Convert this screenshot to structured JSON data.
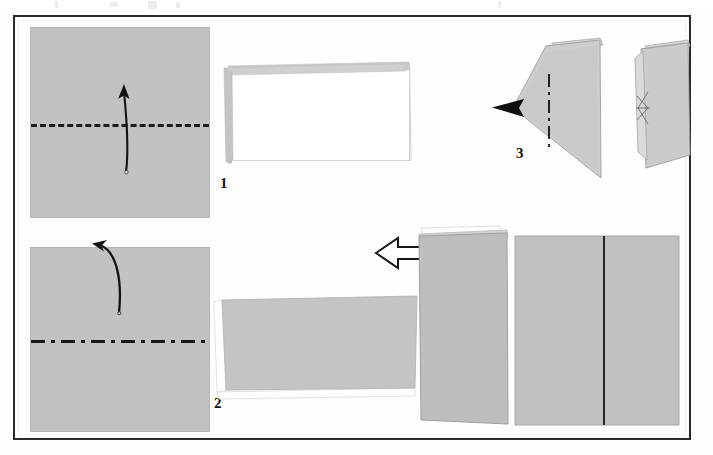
{
  "document": {
    "kind": "origami-instruction-diagram",
    "title": "Origami paper folding sequence",
    "background_color": "#fdfdfd",
    "frame_color": "#2a2a2e",
    "paper_color": "#c2c2c2",
    "paper_back_color": "#ffffff",
    "fold_line_color": "#141414"
  },
  "steps": [
    {
      "number": "1",
      "label": "1",
      "figure": "square-sheet-with-horizontal-valley-fold",
      "fold_type": "valley",
      "fold_orientation": "horizontal",
      "arrow": "curved-up-arrow",
      "result": "folded-rectangle-white-face"
    },
    {
      "number": "2",
      "label": "2",
      "figure": "square-sheet-with-horizontal-mountain-fold",
      "fold_type": "mountain",
      "fold_orientation": "horizontal",
      "arrow": "curved-over-top-arrow",
      "result": "folded-rectangle-gray-face"
    },
    {
      "number": "3",
      "label": "3",
      "figure": "triangular-form-with-vertical-mountain-fold",
      "fold_type": "mountain",
      "fold_orientation": "vertical",
      "arrow": "solid-black-pointer-arrowhead",
      "result": "edge-on-folded-panel"
    },
    {
      "number": "4",
      "label": "4",
      "figure": "narrow-vertical-panel",
      "fold_type": "none",
      "fold_orientation": "vertical",
      "arrow": "hollow-block-arrow-left",
      "result": "wide-panel-with-center-crease"
    }
  ],
  "arrows": {
    "step1_arrow_name": "curved-up-arrow",
    "step2_arrow_name": "curved-over-arrow",
    "step3_arrow_name": "solid-arrowhead",
    "step4_arrow_name": "hollow-left-arrow"
  },
  "labels": {
    "one": "1",
    "two": "2",
    "three": "3",
    "four": "4"
  }
}
